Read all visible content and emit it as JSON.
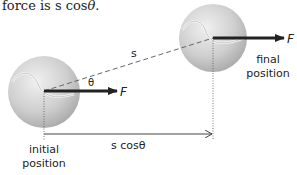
{
  "caption": {
    "prefix": "force is s cos",
    "symbol": "θ",
    "suffix": "."
  },
  "diagram": {
    "displacement_label": "s",
    "angle_label": "θ",
    "force_label_initial": "F",
    "force_label_final": "F",
    "projection_label": "s cosθ",
    "initial_label_line1": "initial",
    "initial_label_line2": "position",
    "final_label_line1": "final",
    "final_label_line2": "position",
    "colors": {
      "ball": "#c8c8c8",
      "ball_highlight": "#eeeeee",
      "arrow": "#222222",
      "dashed_line": "#666666",
      "guide_line": "#555555"
    }
  }
}
